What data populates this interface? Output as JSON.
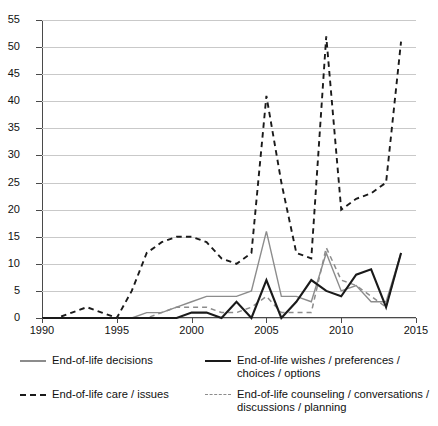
{
  "chart_data": {
    "type": "line",
    "title": "",
    "xlabel": "",
    "ylabel": "",
    "xlim": [
      1990,
      2015
    ],
    "ylim": [
      0,
      55
    ],
    "grid": true,
    "legend_position": "below-plot",
    "x_ticks": [
      "1990",
      "1995",
      "2000",
      "2005",
      "2010",
      "2015"
    ],
    "y_ticks": [
      "0",
      "5",
      "10",
      "15",
      "20",
      "25",
      "30",
      "35",
      "40",
      "45",
      "50",
      "55"
    ],
    "x": [
      1990,
      1991,
      1992,
      1993,
      1994,
      1995,
      1996,
      1997,
      1998,
      1999,
      2000,
      2001,
      2002,
      2003,
      2004,
      2005,
      2006,
      2007,
      2008,
      2009,
      2010,
      2011,
      2012,
      2013,
      2014
    ],
    "series": [
      {
        "name": "End-of-life decisions",
        "style": "solid",
        "color": "#8c8c8c",
        "values": [
          0,
          0,
          0,
          0,
          0,
          0,
          0,
          1,
          1,
          2,
          3,
          4,
          4,
          4,
          5,
          16,
          4,
          4,
          3,
          12,
          5,
          6,
          3,
          3,
          12
        ]
      },
      {
        "name": "End-of-life wishes / preferences / choices / options",
        "style": "solid",
        "color": "#1a1a1a",
        "values": [
          0,
          0,
          0,
          0,
          0,
          0,
          0,
          0,
          0,
          0,
          1,
          1,
          0,
          3,
          0,
          7,
          0,
          3,
          7,
          5,
          4,
          8,
          9,
          2,
          12
        ]
      },
      {
        "name": "End-of-life care / issues",
        "style": "dashed",
        "color": "#1a1a1a",
        "values": [
          0,
          0,
          1,
          2,
          1,
          0,
          5,
          12,
          14,
          15,
          15,
          14,
          11,
          10,
          12,
          41,
          25,
          12,
          11,
          52,
          20,
          22,
          23,
          25,
          51
        ]
      },
      {
        "name": "End-of-life counseling / conversations / discussions / planning",
        "style": "dashed",
        "color": "#8c8c8c",
        "values": [
          0,
          0,
          0,
          0,
          0,
          0,
          0,
          0,
          1,
          2,
          2,
          2,
          1,
          1,
          2,
          4,
          1,
          1,
          1,
          13,
          7,
          6,
          4,
          2,
          12
        ]
      }
    ]
  },
  "legend": {
    "items": [
      {
        "label": "End-of-life decisions",
        "sample": "solid-gray-line-icon"
      },
      {
        "label": "End-of-life wishes / preferences / choices / options",
        "sample": "solid-black-line-icon"
      },
      {
        "label": "End-of-life care / issues",
        "sample": "dashed-black-line-icon"
      },
      {
        "label": "End-of-life counseling / conversations / discussions / planning",
        "sample": "dashed-gray-line-icon"
      }
    ]
  }
}
